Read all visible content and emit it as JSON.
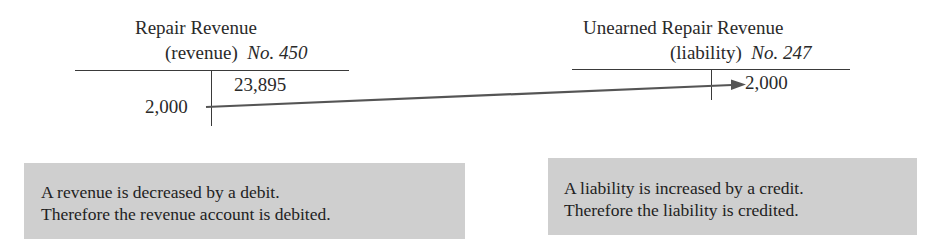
{
  "left_account": {
    "name": "Repair Revenue",
    "type": "(revenue)",
    "number_label": "No. 450",
    "credit_entries": [
      "23,895"
    ],
    "debit_entries": [
      "2,000"
    ]
  },
  "right_account": {
    "name": "Unearned Repair Revenue",
    "type": "(liability)",
    "number_label": "No. 247",
    "credit_entries": [
      "2,000"
    ],
    "debit_entries": []
  },
  "arrow": {
    "from": "left_account.debit",
    "to": "right_account.credit",
    "color": "#555555"
  },
  "notes": {
    "left": {
      "line1": "A revenue is decreased by a debit.",
      "line2": "Therefore the revenue account is debited."
    },
    "right": {
      "line1": "A liability is increased by a credit.",
      "line2": "Therefore the liability is credited."
    }
  },
  "colors": {
    "note_background": "#cfcfcf",
    "line": "#3a3a3a"
  }
}
